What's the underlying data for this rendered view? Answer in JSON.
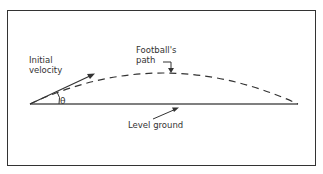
{
  "diagram": {
    "labels": {
      "initial_velocity_line1": "Initial",
      "initial_velocity_line2": "velocity",
      "footballs_path_line1": "Football's",
      "footballs_path_line2": "path",
      "level_ground": "Level  ground",
      "angle": "θ"
    },
    "colors": {
      "stroke": "#333333",
      "ground": "#555555",
      "background": "#ffffff"
    }
  }
}
